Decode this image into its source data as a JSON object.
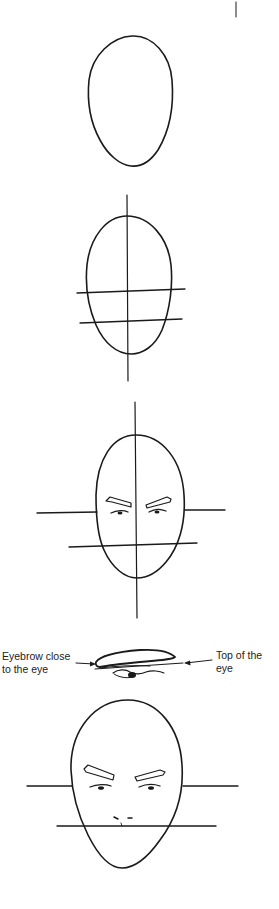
{
  "page": {
    "background": "#ffffff",
    "ink_color": "#1a1a1a"
  },
  "figures": [
    {
      "id": "step-1",
      "description": "Plain egg-shaped head outline"
    },
    {
      "id": "step-2",
      "description": "Head oval with vertical center line and two horizontal guide lines"
    },
    {
      "id": "step-3",
      "description": "Head with guide lines, eyebrows and eyes placed"
    },
    {
      "id": "eye-detail",
      "description": "Close-up of eyebrow and eye with annotation arrows"
    },
    {
      "id": "step-4",
      "description": "Head with eyebrows, eyes and nose placed on guide lines"
    }
  ],
  "annotations": {
    "left": {
      "line1": "Eyebrow close",
      "line2": "to the eye"
    },
    "right": {
      "line1": "Top of the",
      "line2": "eye"
    }
  }
}
